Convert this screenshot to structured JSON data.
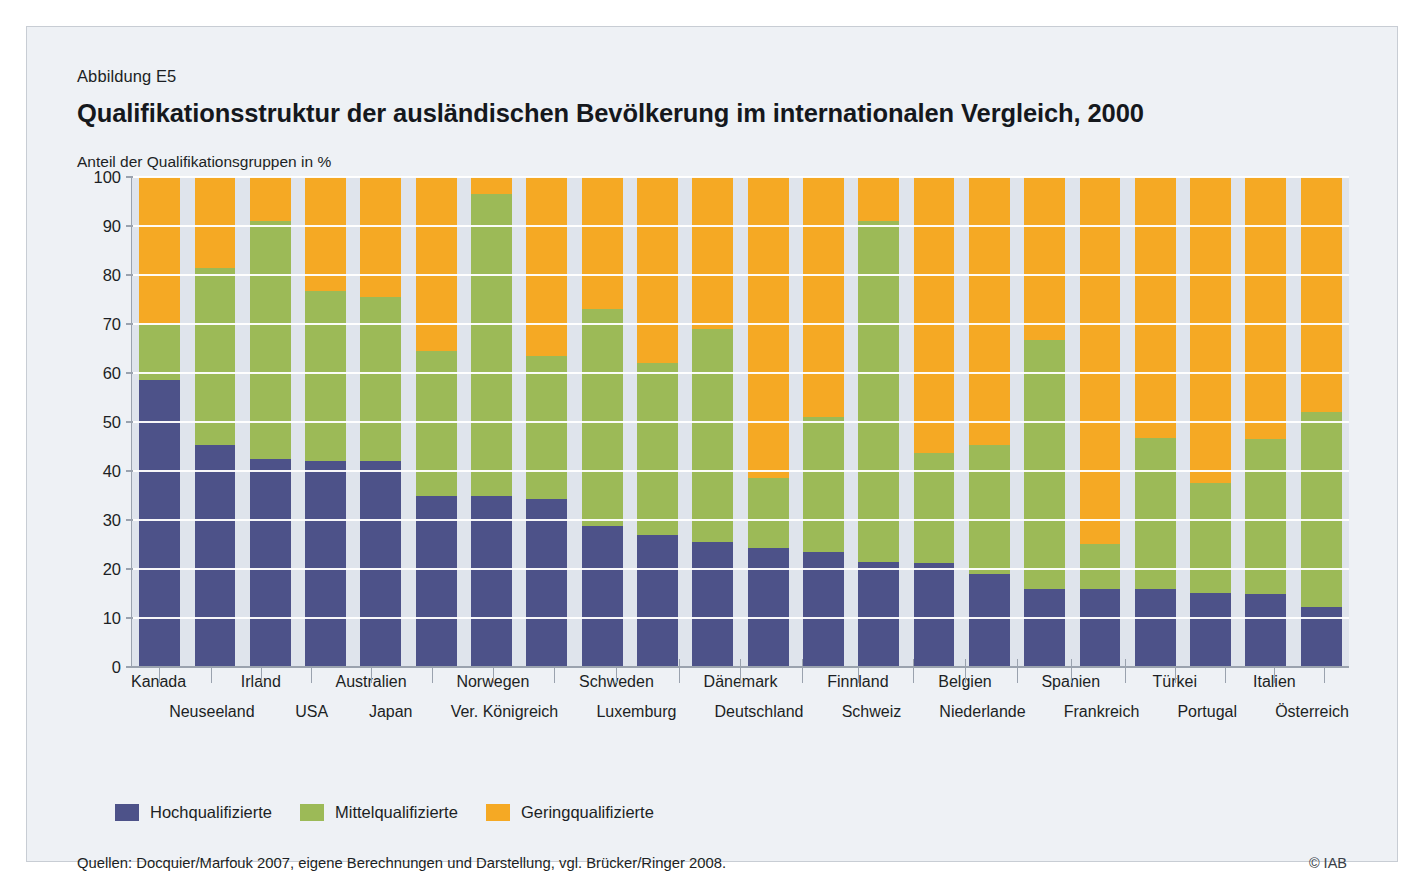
{
  "figure_number": "Abbildung E5",
  "title": "Qualifikationsstruktur der ausländischen Bevölkerung im internationalen Vergleich, 2000",
  "axis_note": "Anteil der Qualifikationsgruppen in %",
  "legend": [
    {
      "label": "Hochqualifizierte",
      "color": "#4d5289"
    },
    {
      "label": "Mittelqualifizierte",
      "color": "#9cba57"
    },
    {
      "label": "Geringqualifizierte",
      "color": "#f5a924"
    }
  ],
  "source": "Quellen: Docquier/Marfouk 2007, eigene Berechnungen und Darstellung, vgl. Brücker/Ringer 2008.",
  "copyright": "© IAB",
  "chart_data": {
    "type": "bar",
    "stacked": true,
    "stack_total": 100,
    "title": "Qualifikationsstruktur der ausländischen Bevölkerung im internationalen Vergleich, 2000",
    "subtitle": "Abbildung E5",
    "xlabel": "",
    "ylabel": "Anteil der Qualifikationsgruppen in %",
    "ylim": [
      0,
      100
    ],
    "yticks": [
      0,
      10,
      20,
      30,
      40,
      50,
      60,
      70,
      80,
      90,
      100
    ],
    "ytick_labels": [
      "0",
      "10",
      "20",
      "30",
      "40",
      "50",
      "60",
      "70",
      "80",
      "90",
      "100"
    ],
    "grid": true,
    "legend_position": "bottom-left",
    "categories": [
      "Kanada",
      "Neuseeland",
      "Irland",
      "USA",
      "Australien",
      "Japan",
      "Norwegen",
      "Ver. Königreich",
      "Schweden",
      "Luxemburg",
      "Dänemark",
      "Deutschland",
      "Finnland",
      "Schweiz",
      "Belgien",
      "Niederlande",
      "Spanien",
      "Frankreich",
      "Türkei",
      "Portugal",
      "Italien",
      "Österreich"
    ],
    "series": [
      {
        "name": "Hochqualifizierte",
        "color": "#4d5289",
        "values": [
          58.5,
          45.3,
          42.5,
          42.1,
          42.1,
          35.0,
          35.0,
          34.3,
          28.8,
          26.9,
          25.5,
          24.3,
          23.5,
          21.5,
          21.2,
          19.0,
          16.0,
          16.0,
          15.9,
          15.2,
          15.0,
          12.2
        ]
      },
      {
        "name": "Mittelqualifizierte",
        "color": "#9cba57",
        "values": [
          11.5,
          36.2,
          48.5,
          34.7,
          33.4,
          29.5,
          61.6,
          29.2,
          44.3,
          35.1,
          43.5,
          14.2,
          27.5,
          69.6,
          22.5,
          26.4,
          50.8,
          9.2,
          30.8,
          22.3,
          31.5,
          39.8
        ]
      },
      {
        "name": "Geringqualifizierte",
        "color": "#f5a924",
        "values": [
          30.0,
          18.5,
          9.0,
          23.2,
          24.5,
          35.5,
          3.4,
          36.5,
          26.9,
          38.0,
          31.0,
          61.5,
          49.0,
          8.9,
          56.3,
          54.6,
          33.2,
          74.8,
          53.3,
          62.5,
          53.5,
          48.0
        ]
      }
    ],
    "stack_tops": {
      "high": [
        58.5,
        45.3,
        42.5,
        42.1,
        42.1,
        35.0,
        35.0,
        34.3,
        28.8,
        26.9,
        25.5,
        24.3,
        23.5,
        21.5,
        21.2,
        19.0,
        16.0,
        16.0,
        15.9,
        15.2,
        15.0,
        12.2
      ],
      "high_plus_mid": [
        70.0,
        81.5,
        91.0,
        76.8,
        75.5,
        64.5,
        96.6,
        63.5,
        73.1,
        62.0,
        69.0,
        38.5,
        51.0,
        91.1,
        43.7,
        45.4,
        66.8,
        25.2,
        46.7,
        37.5,
        46.5,
        52.0
      ]
    }
  }
}
